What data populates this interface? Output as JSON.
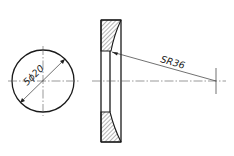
{
  "drawing": {
    "front_view": {
      "dimension_label": "5ϕ20",
      "shape": "circle",
      "center": [
        43,
        81
      ],
      "radius": 31
    },
    "section_view": {
      "shape": "hatched-annular-section",
      "bounds": {
        "x1": 101,
        "x2": 121,
        "y1": 20,
        "y2": 142
      }
    },
    "radius_callout": {
      "label": "SR36",
      "leader_start": [
        111,
        51
      ],
      "leader_end": [
        216,
        81
      ]
    },
    "colors": {
      "line": "#1a1a1a",
      "centerline": "#555555",
      "background": "#ffffff"
    }
  }
}
